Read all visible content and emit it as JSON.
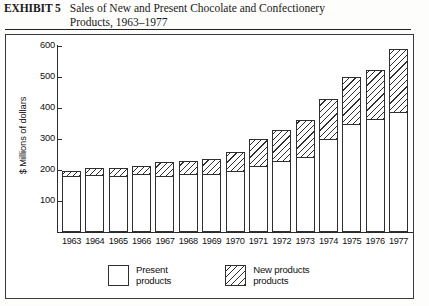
{
  "exhibit": {
    "label": "EXHIBIT 5",
    "title_line1": "Sales of New and Present Chocolate and Confectionery",
    "title_line2": "Products, 1963–1977"
  },
  "legend": {
    "items": [
      {
        "swatch": "white-square",
        "line1": "Present",
        "line2": "products"
      },
      {
        "swatch": "hatched-square",
        "line1": "New products",
        "line2": "products"
      }
    ]
  },
  "chart_data": {
    "type": "bar",
    "subtype": "stacked",
    "title": "Sales of New and Present Chocolate and Confectionery Products, 1963–1977",
    "xlabel": "",
    "ylabel": "$ Millions of dollars",
    "ylim": [
      0,
      600
    ],
    "yticks": [
      100,
      200,
      300,
      400,
      500,
      600
    ],
    "ytick_labels": [
      "100",
      "200",
      "300",
      "400",
      "500",
      "600"
    ],
    "grid": false,
    "legend_position": "bottom",
    "categories": [
      "1963",
      "1964",
      "1965",
      "1966",
      "1967",
      "1968",
      "1969",
      "1970",
      "1971",
      "1972",
      "1973",
      "1974",
      "1975",
      "1976",
      "1977"
    ],
    "series": [
      {
        "name": "Present products",
        "fill": "white",
        "values": [
          180,
          183,
          181,
          188,
          180,
          186,
          186,
          196,
          214,
          228,
          240,
          300,
          348,
          363,
          385
        ]
      },
      {
        "name": "New products",
        "fill": "hatched",
        "values": [
          18,
          22,
          24,
          24,
          44,
          44,
          50,
          62,
          86,
          100,
          122,
          127,
          152,
          160,
          203
        ]
      }
    ],
    "totals": [
      198,
      205,
      205,
      212,
      224,
      230,
      236,
      258,
      300,
      328,
      362,
      427,
      500,
      523,
      588
    ]
  }
}
